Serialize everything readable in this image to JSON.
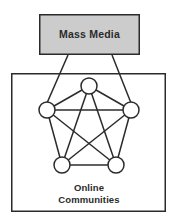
{
  "diagram": {
    "canvas": {
      "width": 176,
      "height": 224,
      "background": "#ffffff"
    },
    "colors": {
      "stroke": "#2b2b2b",
      "media_box_fill": "#cccccc",
      "community_box_fill": "#ffffff",
      "node_fill": "#ffffff",
      "text": "#2b2b2b"
    },
    "nodes_count": "5",
    "edges_count": "10",
    "media_box": {
      "label": "Mass Media",
      "x": 39,
      "y": 14,
      "width": 101,
      "height": 41,
      "fill": "#cccccc"
    },
    "community_box": {
      "label_line1": "Online",
      "label_line2": "Communities",
      "x": 11,
      "y": 73,
      "width": 155,
      "height": 139,
      "fill": "#ffffff"
    },
    "network": {
      "nodes": [
        {
          "id": "n-top",
          "name": "community-node-top",
          "cx": 89,
          "cy": 86,
          "r": 8
        },
        {
          "id": "n-left",
          "name": "community-node-left",
          "cx": 47,
          "cy": 110,
          "r": 8
        },
        {
          "id": "n-right",
          "name": "community-node-right",
          "cx": 131,
          "cy": 110,
          "r": 8
        },
        {
          "id": "n-bottom-left",
          "name": "community-node-bottom-left",
          "cx": 62,
          "cy": 165,
          "r": 8
        },
        {
          "id": "n-bottom-right",
          "name": "community-node-bottom-right",
          "cx": 116,
          "cy": 165,
          "r": 8
        }
      ],
      "edges": [
        {
          "from": "n-top",
          "to": "n-left",
          "name": "edge-top-left"
        },
        {
          "from": "n-top",
          "to": "n-right",
          "name": "edge-top-right"
        },
        {
          "from": "n-top",
          "to": "n-bottom-left",
          "name": "edge-top-bottomleft"
        },
        {
          "from": "n-top",
          "to": "n-bottom-right",
          "name": "edge-top-bottomright"
        },
        {
          "from": "n-left",
          "to": "n-right",
          "name": "edge-left-right"
        },
        {
          "from": "n-left",
          "to": "n-bottom-left",
          "name": "edge-left-bottomleft"
        },
        {
          "from": "n-left",
          "to": "n-bottom-right",
          "name": "edge-left-bottomright"
        },
        {
          "from": "n-right",
          "to": "n-bottom-left",
          "name": "edge-right-bottomleft"
        },
        {
          "from": "n-right",
          "to": "n-bottom-right",
          "name": "edge-right-bottomright"
        },
        {
          "from": "n-bottom-left",
          "to": "n-bottom-right",
          "name": "edge-bottomleft-bottomright"
        }
      ]
    },
    "connectors": [
      {
        "name": "connector-media-to-left-node",
        "x1": 68,
        "y1": 55,
        "x2": 47,
        "y2": 103
      },
      {
        "name": "connector-media-to-right-node",
        "x1": 112,
        "y1": 55,
        "x2": 131,
        "y2": 103
      }
    ]
  }
}
